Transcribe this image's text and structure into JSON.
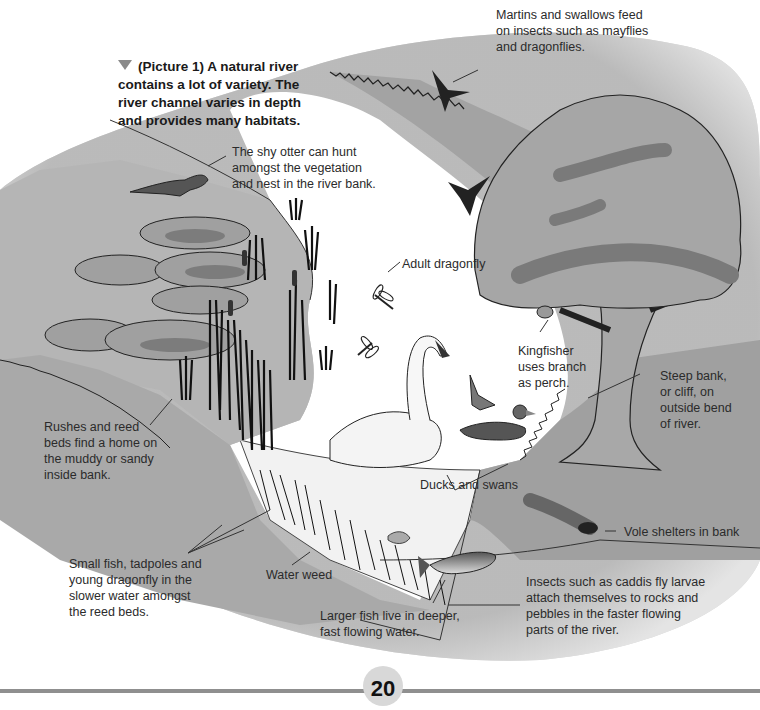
{
  "figure": {
    "caption": "(Picture 1) A natural river\ncontains a lot of variety. The\nriver channel varies in depth\nand provides many habitats.",
    "caption_marker": "triangle-down"
  },
  "labels": {
    "martins": "Martins and swallows feed\non insects such as mayflies\nand dragonflies.",
    "otter": "The shy otter can hunt\namongst the vegetation\nand nest in the river bank.",
    "dragonfly": "Adult dragonfly",
    "kingfisher": "Kingfisher\nuses branch\nas perch.",
    "steep_bank": "Steep bank,\nor cliff, on\noutside bend\nof river.",
    "rushes": "Rushes and reed\nbeds find a home on\nthe muddy or sandy\ninside bank.",
    "ducks_swans": "Ducks and swans",
    "vole": "Vole shelters in bank",
    "small_fish": "Small fish, tadpoles and\nyoung dragonfly in the\nslower water amongst\nthe reed beds.",
    "water_weed": "Water weed",
    "larger_fish": "Larger fish live in deeper,\nfast flowing water.",
    "insects": "Insects such as caddis fly larvae\nattach themselves to rocks and\npebbles in the faster flowing\nparts of the river."
  },
  "footer": {
    "page_number": "20"
  },
  "colors": {
    "bank_gray": "#b4b4b4",
    "bank_dark": "#9a9a9a",
    "foliage": "#a8a8a8",
    "foliage_dark": "#7c7c7c",
    "water": "#ffffff",
    "outline": "#222222"
  }
}
